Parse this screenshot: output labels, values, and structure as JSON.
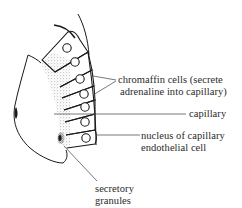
{
  "diagram": {
    "colors": {
      "ink": "#1a1a1a",
      "label_text": "#2a2a2a",
      "leader_line": "#555555",
      "background": "#ffffff"
    },
    "labels": {
      "chromaffin_line1": "chromaffin cells (secrete",
      "chromaffin_line2": "adrenaline into capillary)",
      "capillary": "capillary",
      "nucleus_line1": "nucleus of capillary",
      "nucleus_line2": "endothelial cell",
      "granules_line1": "secretory",
      "granules_line2": "granules"
    },
    "structures": [
      {
        "name": "chromaffin-cell",
        "count": 6,
        "has_nucleus": true
      },
      {
        "name": "capillary-lumen",
        "count": 1
      },
      {
        "name": "capillary-endothelial-nucleus",
        "count": 1
      },
      {
        "name": "secretory-granules",
        "stippled": true
      }
    ]
  }
}
